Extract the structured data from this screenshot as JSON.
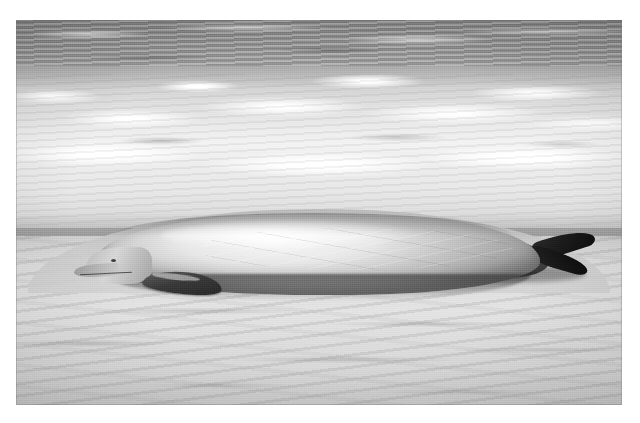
{
  "page": {
    "kind": "photograph",
    "medium": "black-and-white photographic print",
    "width": 640,
    "height": 423,
    "background_color": "#ffffff"
  },
  "photo": {
    "frame": {
      "left": 16,
      "top": 20,
      "width": 606,
      "height": 385,
      "border_color": "#787878"
    },
    "tone": {
      "palette": "grayscale",
      "deep_water": "#8b8b8b",
      "surf_foam": "#f4f4f4",
      "wet_sand": "#b5b5b5",
      "dry_sand": "#dedede",
      "whale_back": "#cacaca",
      "whale_shadow": "#6d6d6d",
      "figures": "#1d1d1d"
    },
    "scene": {
      "subject": "stranded beaked whale on surf-line beach",
      "people_count": 6,
      "viewpoint": "elevated, looking down the beach toward the breaking surf",
      "bands": [
        {
          "name": "deep-water-band",
          "top_pct": 0,
          "height_pct": 17,
          "tone": "mid dark gray with horizontal wave streaks"
        },
        {
          "name": "surf-foam-band",
          "top_pct": 12,
          "height_pct": 42,
          "tone": "bright white broken foam"
        },
        {
          "name": "wet-shore-band",
          "top_pct": 50,
          "height_pct": 14,
          "tone": "mid gray wet sand"
        },
        {
          "name": "dry-sand-band",
          "top_pct": 56,
          "height_pct": 44,
          "tone": "light gray rippled sand"
        }
      ]
    },
    "whale": {
      "label": "stranded-whale",
      "orientation": "head to the left, tail flukes to the right",
      "parts": [
        {
          "name": "head",
          "note": "rounded melon, tapering beak"
        },
        {
          "name": "beak",
          "note": "short pointed rostrum resting in wet sand"
        },
        {
          "name": "mouth-line",
          "note": "dark curved gape line"
        },
        {
          "name": "eye",
          "note": "small dark spot behind the beak"
        },
        {
          "name": "pectoral-flipper",
          "note": "dark flipper folded against the flank"
        },
        {
          "name": "body",
          "note": "pale sunlit flank, dark under-shadow"
        },
        {
          "name": "scars",
          "note": "fine pale rake scratches along the back"
        },
        {
          "name": "peduncle",
          "note": "dark tail stock"
        },
        {
          "name": "fluke-upper",
          "note": "dark upper tail fluke raised"
        },
        {
          "name": "fluke-lower",
          "note": "dark lower tail fluke"
        }
      ]
    },
    "people": [
      {
        "id": 1,
        "label": "person-1",
        "pose": "crouching, both hands on the whale",
        "position_pct": {
          "x": 22,
          "y": 40
        },
        "tone": "dark silhouette, light hair"
      },
      {
        "id": 2,
        "label": "person-2",
        "pose": "standing upright, arms down at the whale",
        "position_pct": {
          "x": 33,
          "y": 33
        },
        "tone": "bare torso, dark hair"
      },
      {
        "id": 3,
        "label": "person-3",
        "pose": "standing, bearded, hands resting on the back",
        "position_pct": {
          "x": 42,
          "y": 34
        },
        "tone": "bare torso, beard"
      },
      {
        "id": 4,
        "label": "person-4",
        "pose": "leaning forward, hands on the whale",
        "position_pct": {
          "x": 53,
          "y": 36
        },
        "tone": "bare torso, long hair"
      },
      {
        "id": 5,
        "label": "person-5",
        "pose": "kneeling beside the whale",
        "position_pct": {
          "x": 64,
          "y": 36
        },
        "tone": "dark clothing"
      },
      {
        "id": 6,
        "label": "person-6",
        "pose": "bending over, hands pressed to the flank",
        "position_pct": {
          "x": 76,
          "y": 40
        },
        "tone": "bare torso, long light hair"
      }
    ],
    "texture": {
      "grain": "visible silver-halide print grain",
      "sand_marks": "diagonal tide and footprint streaks across the foreground"
    }
  }
}
